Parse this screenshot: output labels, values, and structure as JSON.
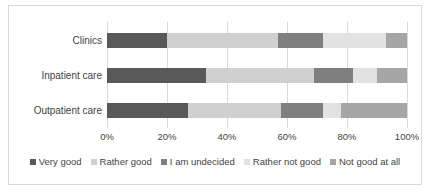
{
  "chart_data": {
    "type": "bar",
    "orientation": "horizontal",
    "stacked": true,
    "normalized": true,
    "title": "",
    "xlabel": "",
    "ylabel": "",
    "categories": [
      "Clinics",
      "Inpatient care",
      "Outpatient care"
    ],
    "series": [
      {
        "name": "Very good",
        "color": "#595959",
        "values": [
          20,
          33,
          27
        ]
      },
      {
        "name": "Rather good",
        "color": "#d0d0d0",
        "values": [
          37,
          36,
          31
        ]
      },
      {
        "name": "I am undecided",
        "color": "#7f7f7f",
        "values": [
          15,
          13,
          14
        ]
      },
      {
        "name": "Rather not good",
        "color": "#e2e2e2",
        "values": [
          21,
          8,
          6
        ]
      },
      {
        "name": "Not good at all",
        "color": "#a6a6a6",
        "values": [
          7,
          10,
          22
        ]
      }
    ],
    "xlim": [
      0,
      100
    ],
    "xticks": [
      0,
      20,
      40,
      60,
      80,
      100
    ],
    "xtick_labels": [
      "0%",
      "20%",
      "40%",
      "60%",
      "80%",
      "100%"
    ],
    "grid": true,
    "grid_axis": "x",
    "legend_position": "bottom",
    "plot_background": "#ffffff",
    "grid_color": "#d9d9d9",
    "border_color": "#d9d9d9",
    "text_color": "#3f3f3f"
  }
}
